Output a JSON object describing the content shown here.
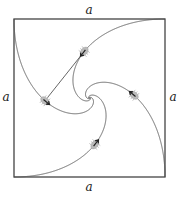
{
  "diagram": {
    "square": {
      "x0": 14,
      "y0": 19,
      "x1": 165,
      "y1": 177
    },
    "labels": {
      "top": "a",
      "left": "a",
      "right": "a",
      "bottom": "a"
    },
    "corners": [
      "top-left",
      "bottom-left",
      "bottom-right",
      "top-right"
    ],
    "pursuit_direction": "counter-clockwise (each bug heads toward the next corner's bug)",
    "bug_snapshot_fraction": 0.2,
    "colors": {
      "stroke": "#555555",
      "square": "#444444",
      "bug": "#bbbbbb",
      "arrow": "#222222"
    }
  }
}
